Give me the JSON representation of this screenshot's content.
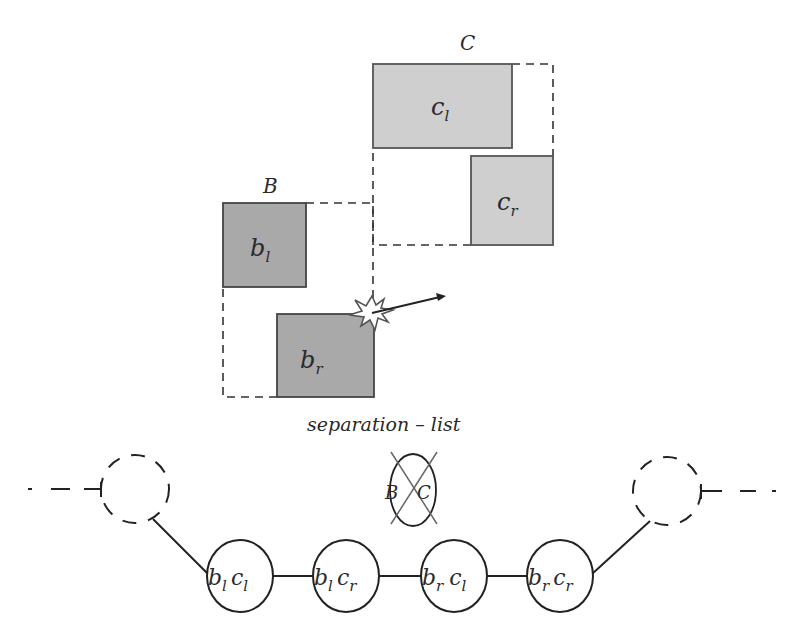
{
  "diagram": {
    "colors": {
      "stroke": "#333333",
      "box_b_fill": "#a9a9a9",
      "box_c_fill": "#cfcfcf",
      "background": "#ffffff"
    },
    "group_c": {
      "label": "C",
      "boxes": [
        {
          "id": "c_l",
          "base": "c",
          "sub": "l"
        },
        {
          "id": "c_r",
          "base": "c",
          "sub": "r"
        }
      ]
    },
    "group_b": {
      "label": "B",
      "boxes": [
        {
          "id": "b_l",
          "base": "b",
          "sub": "l"
        },
        {
          "id": "b_r",
          "base": "b",
          "sub": "r"
        }
      ]
    },
    "collision": {
      "icon": "collision-burst-icon",
      "arrow": "direction-arrow-icon"
    },
    "separation_list": {
      "label": "separation – list",
      "removed_node": {
        "left": "B",
        "right": "C",
        "icon": "cross-out-icon"
      }
    },
    "list_nodes": [
      {
        "b": "b",
        "b_sub": "l",
        "c": "c",
        "c_sub": "l"
      },
      {
        "b": "b",
        "b_sub": "l",
        "c": "c",
        "c_sub": "r"
      },
      {
        "b": "b",
        "b_sub": "r",
        "c": "c",
        "c_sub": "l"
      },
      {
        "b": "b",
        "b_sub": "r",
        "c": "c",
        "c_sub": "r"
      }
    ]
  }
}
